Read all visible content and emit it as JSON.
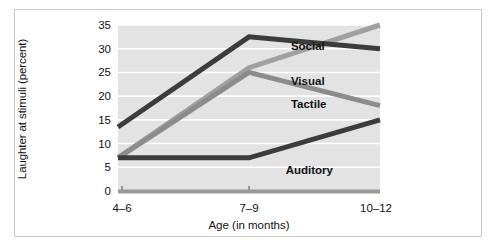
{
  "figure": {
    "border_color": "#c9c9c9",
    "background": "#ffffff"
  },
  "chart_data": {
    "type": "line",
    "title": "",
    "subtitle": "",
    "xlabel": "Age (in months)",
    "ylabel": "Laughter at stimuli (percent)",
    "categories": [
      "4–6",
      "7–9",
      "10–12"
    ],
    "x_tick_labels": [
      "4–6",
      "7–9",
      "10–12"
    ],
    "y_tick_labels": [
      "0",
      "5",
      "10",
      "15",
      "20",
      "25",
      "30",
      "35"
    ],
    "y_ticks": [
      0,
      5,
      10,
      15,
      20,
      25,
      30,
      35
    ],
    "ylim": [
      0,
      35
    ],
    "grid": "horizontal",
    "grid_color": "#ffffff",
    "plot_background": "#e3e3e3",
    "legend_position": "inline-labels",
    "series": [
      {
        "name": "Social",
        "values": [
          13.5,
          32.5,
          30
        ],
        "color": "#3c3c3c",
        "label_x_pct": 66,
        "label_y_pct": 9
      },
      {
        "name": "Visual",
        "values": [
          7,
          26,
          35
        ],
        "color": "#a0a0a0",
        "label_x_pct": 66,
        "label_y_pct": 30
      },
      {
        "name": "Tactile",
        "values": [
          7,
          25,
          18
        ],
        "color": "#8c8c8c",
        "label_x_pct": 66,
        "label_y_pct": 44
      },
      {
        "name": "Auditory",
        "values": [
          7,
          7,
          15
        ],
        "color": "#3c3c3c",
        "label_x_pct": 64,
        "label_y_pct": 84
      }
    ]
  }
}
